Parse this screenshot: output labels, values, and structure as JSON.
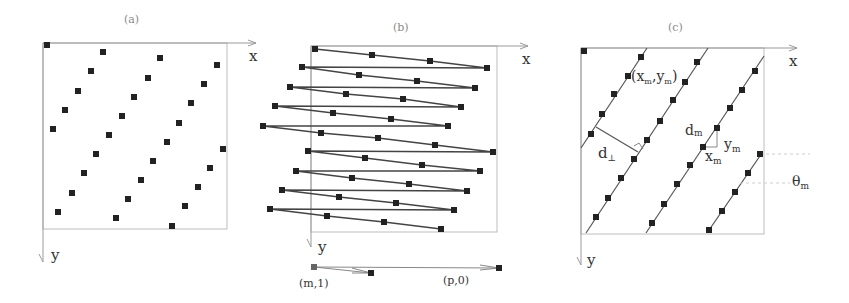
{
  "figure": {
    "panels": [
      {
        "id": "a",
        "title": "(a)",
        "x_axis_label": "x",
        "y_axis_label": "y",
        "points": [
          [
            47,
            45
          ],
          [
            103,
            52
          ],
          [
            160,
            58
          ],
          [
            217,
            65
          ],
          [
            91,
            71
          ],
          [
            148,
            78
          ],
          [
            204,
            84
          ],
          [
            78,
            91
          ],
          [
            134,
            97
          ],
          [
            191,
            103
          ],
          [
            65,
            110
          ],
          [
            122,
            116
          ],
          [
            179,
            123
          ],
          [
            53,
            129
          ],
          [
            109,
            135
          ],
          [
            167,
            142
          ],
          [
            223,
            149
          ],
          [
            96,
            154
          ],
          [
            153,
            161
          ],
          [
            210,
            168
          ],
          [
            84,
            173
          ],
          [
            141,
            180
          ],
          [
            198,
            187
          ],
          [
            72,
            193
          ],
          [
            128,
            199
          ],
          [
            185,
            206
          ],
          [
            58,
            212
          ],
          [
            116,
            218
          ],
          [
            172,
            226
          ]
        ]
      },
      {
        "id": "b",
        "title": "(b)",
        "x_axis_label": "x",
        "y_axis_label": "y",
        "rows": [
          [
            [
              315,
              49
            ],
            [
              372,
              55
            ],
            [
              430,
              61
            ],
            [
              487,
              68
            ]
          ],
          [
            [
              302,
              67
            ],
            [
              359,
              75
            ],
            [
              417,
              81
            ],
            [
              475,
              88
            ]
          ],
          [
            [
              290,
              87
            ],
            [
              346,
              94
            ],
            [
              403,
              99
            ],
            [
              461,
              107
            ]
          ],
          [
            [
              275,
              106
            ],
            [
              333,
              113
            ],
            [
              391,
              119
            ],
            [
              448,
              126
            ]
          ],
          [
            [
              263,
              126
            ],
            [
              321,
              133
            ],
            [
              378,
              138
            ],
            [
              435,
              145
            ],
            [
              493,
              152
            ]
          ],
          [
            [
              308,
              151
            ],
            [
              365,
              158
            ],
            [
              422,
              165
            ],
            [
              480,
              171
            ]
          ],
          [
            [
              296,
              171
            ],
            [
              352,
              178
            ],
            [
              409,
              184
            ],
            [
              467,
              191
            ]
          ],
          [
            [
              282,
              190
            ],
            [
              339,
              197
            ],
            [
              396,
              203
            ],
            [
              454,
              210
            ]
          ],
          [
            [
              270,
              209
            ],
            [
              327,
              216
            ],
            [
              384,
              222
            ],
            [
              441,
              229
            ]
          ]
        ],
        "vector_labels": [
          "(m,1)",
          "(p,0)"
        ]
      },
      {
        "id": "c",
        "title": "(c)",
        "x_axis_label": "x",
        "y_axis_label": "y",
        "labels": {
          "point": "(x",
          "point_sub1": "m",
          "point_mid": ",y",
          "point_sub2": "m",
          "point_end": ")",
          "d_perp": "d",
          "d_perp_sub": "⊥",
          "d_m": "d",
          "d_m_sub": "m",
          "y_m": "y",
          "y_m_sub": "m",
          "x_m": "x",
          "x_m_sub": "m",
          "theta_m": "θ",
          "theta_m_sub": "m"
        }
      }
    ]
  }
}
